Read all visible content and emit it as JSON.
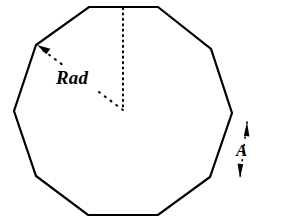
{
  "figure": {
    "background_color": "#ffffff",
    "stroke_color": "#000000",
    "stroke_width": 2,
    "labels": {
      "radius_label": "Rad",
      "side_label": "A"
    },
    "shape": {
      "name": "decagon",
      "sides": 10,
      "center": {
        "x": 123,
        "y": 110
      },
      "vertices": [
        {
          "x": 89,
          "y": 7
        },
        {
          "x": 158,
          "y": 7
        },
        {
          "x": 211,
          "y": 49
        },
        {
          "x": 232,
          "y": 113
        },
        {
          "x": 210,
          "y": 177
        },
        {
          "x": 158,
          "y": 215
        },
        {
          "x": 88,
          "y": 215
        },
        {
          "x": 36,
          "y": 176
        },
        {
          "x": 14,
          "y": 111
        },
        {
          "x": 36,
          "y": 45
        }
      ]
    },
    "annotations": {
      "apothem_line": {
        "name": "dotted-vertical-apothem",
        "style": "dotted",
        "from": {
          "x": 123,
          "y": 8
        },
        "to": {
          "x": 123,
          "y": 110
        }
      },
      "radius_line": {
        "name": "dotted-diagonal-radius",
        "style": "dotted",
        "from": {
          "x": 123,
          "y": 110
        },
        "to": {
          "x": 40,
          "y": 48
        },
        "arrow_at": "to"
      },
      "side_measure": {
        "name": "double-headed-side-arrow",
        "style": "dotted",
        "from": {
          "x": 247,
          "y": 122
        },
        "to": {
          "x": 240,
          "y": 178
        },
        "arrow_at": "both"
      }
    }
  }
}
